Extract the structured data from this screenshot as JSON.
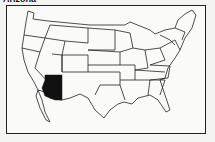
{
  "title": "Arizona",
  "map": {
    "region": "Contiguous United States",
    "highlighted_state": "Arizona",
    "highlight_color": "#111111",
    "outline_color": "#222222",
    "background": "#fafaf8"
  }
}
